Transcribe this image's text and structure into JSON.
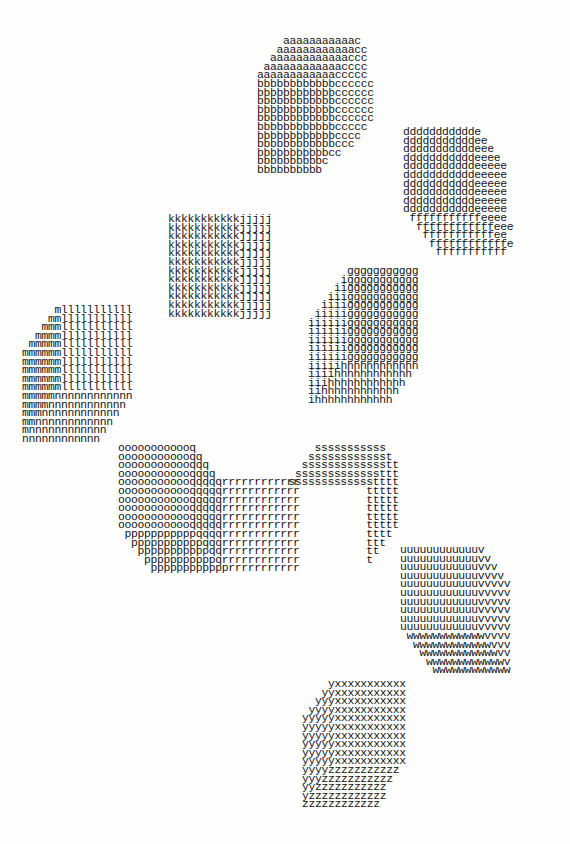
{
  "artwork": {
    "type": "typewriter-art",
    "ink_color": "#151515",
    "paper_color": "#fefefe",
    "blocks": [
      {
        "id": "abc",
        "letters": [
          "a",
          "b",
          "c"
        ],
        "lines": [
          "    aaaaaaaaaaac",
          "   aaaaaaaaaaaacc",
          "  aaaaaaaaaaaaccc",
          " aaaaaaaaaaaacccc",
          "aaaaaaaaaaaaccccc",
          "bbbbbbbbbbbbcccccc",
          "bbbbbbbbbbbbcccccc",
          "bbbbbbbbbbbbcccccc",
          "bbbbbbbbbbbbcccccc",
          "bbbbbbbbbbbbcccccc",
          "bbbbbbbbbbbbccccc",
          "bbbbbbbbbbbbcccc",
          "bbbbbbbbbbbbccc",
          "bbbbbbbbbbbcc",
          "bbbbbbbbbbc",
          "bbbbbbbbbb"
        ]
      },
      {
        "id": "def",
        "letters": [
          "d",
          "e",
          "f"
        ],
        "lines": [
          "ddddddddddde",
          "dddddddddddee",
          "dddddddddddeee",
          "dddddddddddeeee",
          "dddddddddddeeeee",
          "dddddddddddeeeee",
          "dddddddddddeeeee",
          "dddddddddddeeeee",
          "dddddddddddeeeee",
          "dddddddddddeeeee",
          " fffffffffffeeee",
          "  ffffffffffffeee",
          "   fffffffffffee",
          "    ffffffffffffe",
          "     fffffffffff"
        ]
      },
      {
        "id": "kj",
        "letters": [
          "k",
          "j"
        ],
        "lines": [
          "kkkkkkkkkkkjjjjj",
          "kkkkkkkkkkkjjjjj",
          "kkkkkkkkkkkjjjjj",
          "kkkkkkkkkkkjjjjj",
          "kkkkkkkkkkkjjjjj",
          "kkkkkkkkkkkjjjjj",
          "kkkkkkkkkkkjjjjj",
          "kkkkkkkkkkkjjjjj",
          "kkkkkkkkkkkjjjjj",
          "kkkkkkkkkkkjjjjj",
          "kkkkkkkkkkkjjjjj",
          "kkkkkkkkkkkjjjjj"
        ]
      },
      {
        "id": "gih",
        "letters": [
          "g",
          "i",
          "h"
        ],
        "lines": [
          "      ggggggggggg",
          "     iggggggggggg",
          "    iiggggggggggg",
          "   iiiggggggggggg",
          "  iiiiggggggggggg",
          " iiiiiggggggggggg",
          "iiiiiiggggggggggg",
          "iiiiiiggggggggggg",
          "iiiiiiggggggggggg",
          "iiiiiiggggggggggg",
          "iiiiiiggggggggggg",
          "iiiiihhhhhhhhhhhh",
          "iiiihhhhhhhhhhhh",
          "iiihhhhhhhhhhhh",
          "iihhhhhhhhhhhh",
          "ihhhhhhhhhhhh"
        ]
      },
      {
        "id": "mln",
        "letters": [
          "m",
          "l",
          "n"
        ],
        "lines": [
          "     mlllllllllll",
          "    mmlllllllllll",
          "   mmmlllllllllll",
          "  mmmmlllllllllll",
          " mmmmmlllllllllll",
          "mmmmmmlllllllllll",
          "mmmmmmlllllllllll",
          "mmmmmmlllllllllll",
          "mmmmmmlllllllllll",
          "mmmmmmlllllllllll",
          "mmmmmnnnnnnnnnnnn",
          "mmmmnnnnnnnnnnnn",
          "mmmnnnnnnnnnnnn",
          "mmnnnnnnnnnnnn",
          "mnnnnnnnnnnnn",
          "nnnnnnnnnnnn"
        ]
      },
      {
        "id": "oqpr",
        "letters": [
          "o",
          "q",
          "p",
          "r"
        ],
        "lines": [
          "oooooooooooq",
          "oooooooooooqq",
          "oooooooooooqqq",
          "oooooooooooqqqq",
          "oooooooooooqqqqqrrrrrrrrrrrr",
          "oooooooooooqqqqqrrrrrrrrrrrr",
          "oooooooooooqqqqqrrrrrrrrrrrr",
          "oooooooooooqqqqqrrrrrrrrrrrr",
          "oooooooooooqqqqqrrrrrrrrrrrr",
          "oooooooooooqqqqqrrrrrrrrrrrr",
          " pppppppppppqqqqrrrrrrrrrrrr",
          "  pppppppppppqqqrrrrrrrrrrrr",
          "   pppppppppppqqrrrrrrrrrrrr",
          "    pppppppppppqrrrrrrrrrrrr",
          "     pppppppppppprrrrrrrrrrr"
        ]
      },
      {
        "id": "st",
        "letters": [
          "s",
          "t"
        ],
        "lines": [
          "     sssssssssss",
          "    sssssssssssst",
          "   ssssssssssssstt",
          "  sssssssssssssttt",
          " ssssssssssssstttt",
          "             ttttt",
          "             ttttt",
          "             ttttt",
          "             ttttt",
          "             ttttt",
          "             tttt",
          "             ttt",
          "             tt",
          "             t"
        ]
      },
      {
        "id": "uvw",
        "letters": [
          "u",
          "v",
          "w"
        ],
        "lines": [
          "uuuuuuuuuuuuv",
          "uuuuuuuuuuuuvv",
          "uuuuuuuuuuuuvvv",
          "uuuuuuuuuuuuvvvv",
          "uuuuuuuuuuuuvvvvv",
          "uuuuuuuuuuuuvvvvv",
          "uuuuuuuuuuuuvvvvv",
          "uuuuuuuuuuuuvvvvv",
          "uuuuuuuuuuuuvvvvv",
          "uuuuuuuuuuuuvvvvv",
          " wwwwwwwwwwwwvvvv",
          "  wwwwwwwwwwwwvvv",
          "   wwwwwwwwwwwwvv",
          "    wwwwwwwwwwwwv",
          "     wwwwwwwwwwww"
        ]
      },
      {
        "id": "yxz",
        "letters": [
          "y",
          "x",
          "z"
        ],
        "lines": [
          "    yxxxxxxxxxxx",
          "   yyxxxxxxxxxxx",
          "  yyyxxxxxxxxxxx",
          " yyyyxxxxxxxxxxx",
          "yyyyyxxxxxxxxxxx",
          "yyyyyxxxxxxxxxxx",
          "yyyyyxxxxxxxxxxx",
          "yyyyyxxxxxxxxxxx",
          "yyyyyxxxxxxxxxxx",
          "yyyyyxxxxxxxxxxx",
          "yyyyzzzzzzzzzzz",
          "yyyzzzzzzzzzzz",
          "yyzzzzzzzzzzz",
          "yzzzzzzzzzzzz",
          "zzzzzzzzzzzz"
        ]
      }
    ]
  }
}
